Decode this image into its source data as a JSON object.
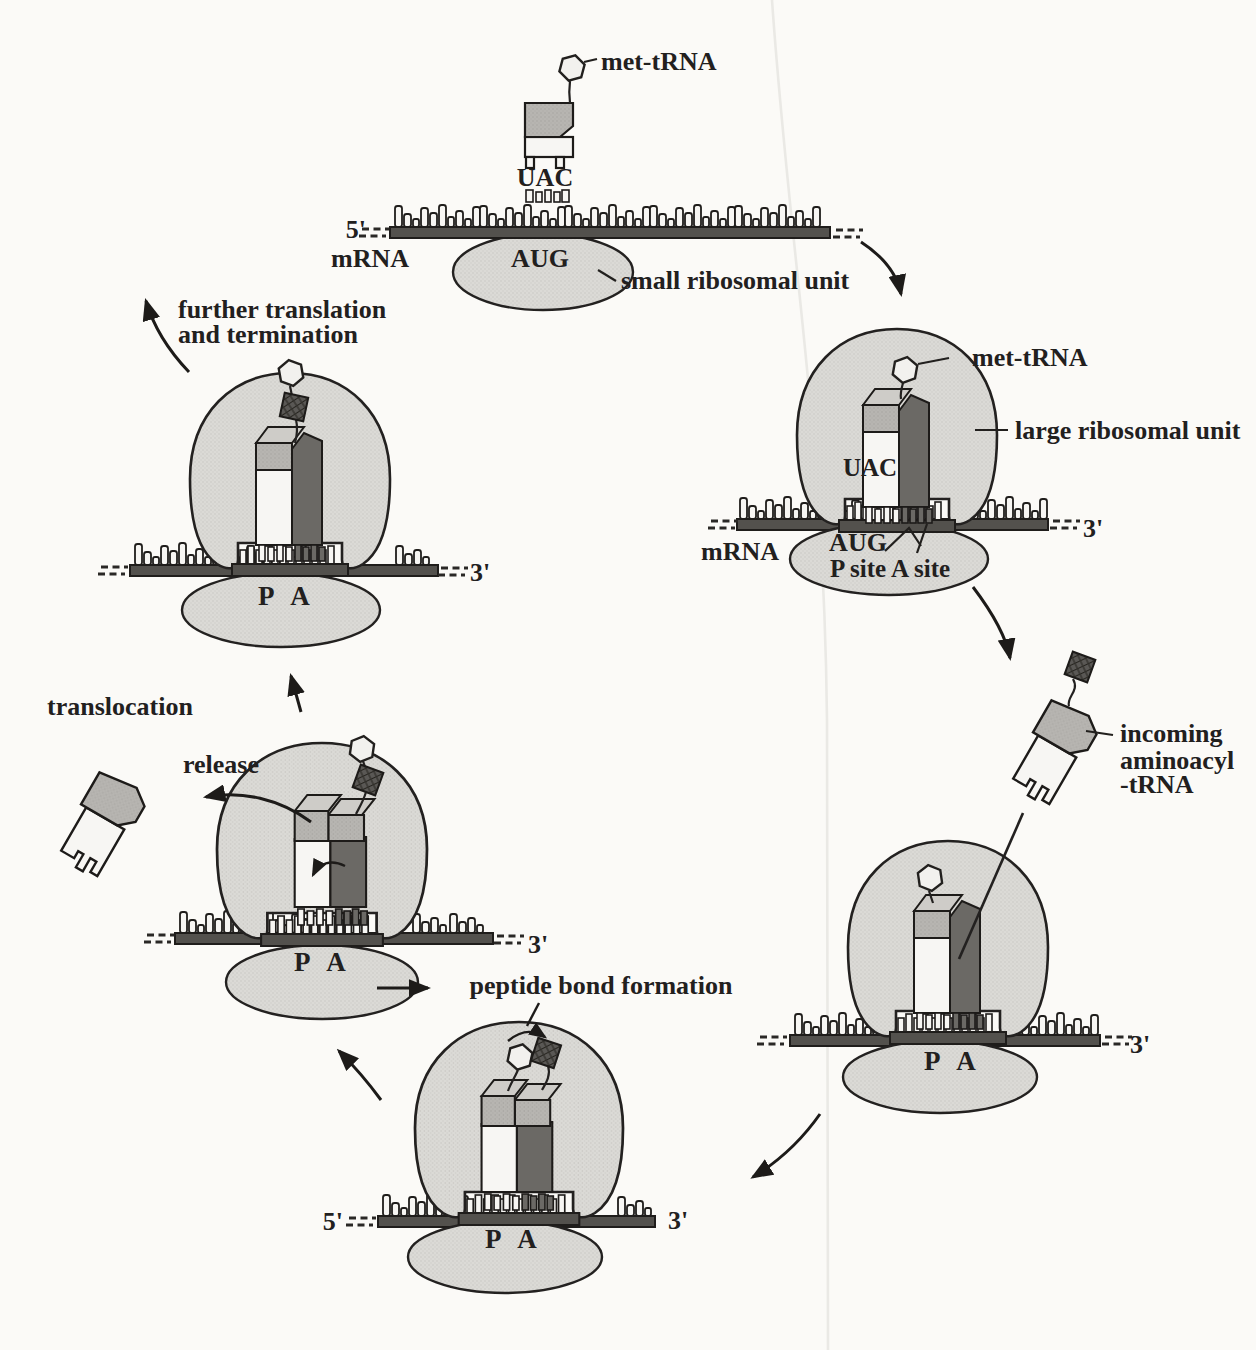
{
  "palette": {
    "background": "#fbfaf7",
    "outline": "#232120",
    "ribosome_fill": "#dbdad6",
    "trna_head": "#b7b5b1",
    "trna_head_top": "#ceccc8",
    "trna_body": "#f7f6f3",
    "a_site_column": "#6b6965",
    "mrna_bar": "#53514d",
    "amino_acid_dark": "#4a4846",
    "hexagon_fill": "#f2f1ee"
  },
  "stage1": {
    "met_trna": "met-tRNA",
    "uac": "UAC",
    "five_prime": "5'",
    "mrna_label": "mRNA",
    "aug": "AUG",
    "small_subunit_label": "small ribosomal unit"
  },
  "stage2": {
    "met_trna": "met-tRNA",
    "large_subunit_label": "large ribosomal unit",
    "uac": "UAC",
    "mrna_label": "mRNA",
    "aug": "AUG",
    "site_labels": "P site A site",
    "three_prime": "3'"
  },
  "stage3": {
    "incoming_label_line1": "incoming",
    "incoming_label_line2": "aminoacyl",
    "incoming_label_line3": "-tRNA",
    "site_letters": "P A",
    "three_prime": "3'"
  },
  "stage4": {
    "caption": "peptide bond formation",
    "five_prime": "5'",
    "three_prime": "3'",
    "site_letters": "P A"
  },
  "stage5": {
    "translocation_label": "translocation",
    "release_label": "release",
    "site_letters": "P A",
    "three_prime": "3'"
  },
  "stage6": {
    "caption_line1": "further translation",
    "caption_line2": "and termination",
    "site_letters": "P A",
    "three_prime": "3'"
  }
}
